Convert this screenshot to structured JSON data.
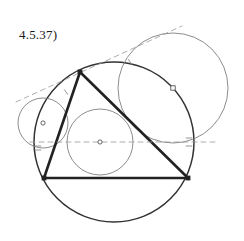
{
  "figure": {
    "label": "4.5.37)",
    "width": 244,
    "height": 241,
    "background_color": "#ffffff",
    "stroke_dark": "#222222",
    "stroke_medium": "#555555",
    "stroke_light": "#888888",
    "stroke_dashed": "#999999"
  },
  "chart_data": {
    "type": "diagram",
    "title": "4.5.37)",
    "subtitle": "",
    "xlabel": "",
    "ylabel": "",
    "grid": false,
    "legend": "none",
    "xlim": [
      0,
      244
    ],
    "ylim": [
      0,
      241
    ],
    "points": [
      {
        "name": "A",
        "role": "triangle-apex-vertex",
        "x": 80,
        "y": 72,
        "marker": "square",
        "label": ""
      },
      {
        "name": "B",
        "role": "triangle-bottom-left-vertex",
        "x": 44,
        "y": 178,
        "marker": "square",
        "label": ""
      },
      {
        "name": "C",
        "role": "triangle-bottom-right-vertex",
        "x": 188,
        "y": 178,
        "marker": "square",
        "label": ""
      },
      {
        "name": "I",
        "role": "incircle-center",
        "x": 100,
        "y": 142,
        "marker": "circle-open",
        "label": ""
      },
      {
        "name": "J1",
        "role": "left-excircle-center",
        "x": 43,
        "y": 123,
        "marker": "circle-open",
        "label": ""
      },
      {
        "name": "J2",
        "role": "upper-right-excircle-center",
        "x": 173,
        "y": 88,
        "marker": "square-open",
        "label": ""
      }
    ],
    "segments": [
      {
        "name": "side-AB",
        "from": [
          80,
          72
        ],
        "to": [
          44,
          178
        ],
        "style": "solid",
        "weight": "heavy",
        "color": "#222222"
      },
      {
        "name": "side-AC",
        "from": [
          80,
          72
        ],
        "to": [
          188,
          178
        ],
        "style": "solid",
        "weight": "heavy",
        "color": "#222222"
      },
      {
        "name": "side-BC",
        "from": [
          44,
          178
        ],
        "to": [
          188,
          178
        ],
        "style": "solid",
        "weight": "heavy",
        "color": "#222222"
      },
      {
        "name": "tangent-line",
        "from": [
          16,
          102
        ],
        "to": [
          182,
          26
        ],
        "style": "dashed",
        "weight": "light",
        "color": "#999999"
      },
      {
        "name": "horizontal-center-line",
        "from": [
          30,
          142
        ],
        "to": [
          218,
          142
        ],
        "style": "dashed",
        "weight": "light",
        "color": "#999999"
      }
    ],
    "circles": [
      {
        "name": "circumcircle",
        "cx": 114,
        "cy": 142,
        "r": 80,
        "style": "solid",
        "weight": "medium",
        "color": "#333333"
      },
      {
        "name": "incircle",
        "cx": 100,
        "cy": 142,
        "r": 33,
        "style": "solid",
        "weight": "thin",
        "color": "#777777"
      },
      {
        "name": "left-excircle",
        "cx": 43,
        "cy": 123,
        "r": 25,
        "style": "solid",
        "weight": "thin",
        "color": "#777777"
      },
      {
        "name": "upper-right-excircle",
        "cx": 173,
        "cy": 88,
        "r": 55,
        "style": "solid",
        "weight": "thin",
        "color": "#777777"
      }
    ],
    "tick_marks": [
      {
        "name": "tangency-tick-left",
        "x": 38,
        "y": 146,
        "angle": 0
      },
      {
        "name": "tangency-tick-left-2",
        "x": 38,
        "y": 150,
        "angle": 0
      },
      {
        "name": "tangency-tick-upper-left",
        "x": 66,
        "y": 92,
        "angle": 55
      },
      {
        "name": "tangency-tick-upper-right",
        "x": 130,
        "y": 62,
        "angle": 60
      },
      {
        "name": "tangency-tick-right",
        "x": 189,
        "y": 138,
        "angle": 0
      },
      {
        "name": "tangency-tick-right-2",
        "x": 189,
        "y": 146,
        "angle": 0
      }
    ]
  }
}
